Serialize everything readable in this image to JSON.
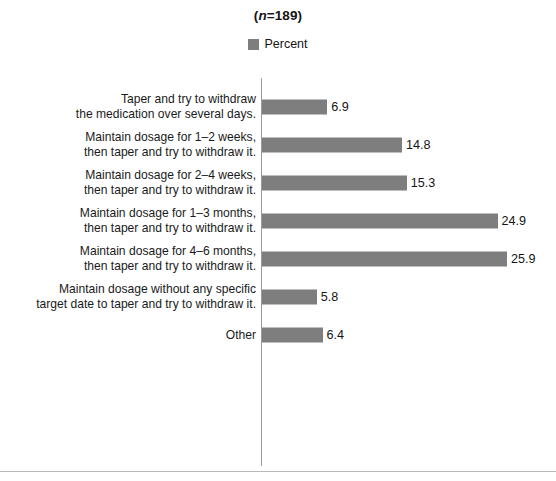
{
  "chart_data": {
    "type": "bar",
    "orientation": "horizontal",
    "title": "(n=189)",
    "title_prefix": "(",
    "title_italic": "n",
    "title_suffix": "=189)",
    "xlabel": "",
    "ylabel": "",
    "grid": false,
    "legend_position": "top-center",
    "legend": [
      "Percent"
    ],
    "series": [
      {
        "name": "Percent",
        "color": "#7e7e7e",
        "values": [
          6.9,
          14.8,
          15.3,
          24.9,
          25.9,
          5.8,
          6.4
        ]
      }
    ],
    "categories": [
      "Taper and try to withdraw\nthe medication over several days.",
      "Maintain dosage for 1–2 weeks,\nthen taper and try to withdraw it.",
      "Maintain dosage for 2–4 weeks,\nthen taper and try to withdraw it.",
      "Maintain dosage for 1–3 months,\nthen taper and try to withdraw it.",
      "Maintain dosage for 4–6 months,\nthen taper and try to withdraw it.",
      "Maintain dosage without any specific\ntarget date to taper and try to withdraw it.",
      "Other"
    ],
    "value_labels": [
      "6.9",
      "14.8",
      "15.3",
      "24.9",
      "25.9",
      "5.8",
      "6.4"
    ],
    "xlim": [
      0,
      25.9
    ],
    "axis_color": "#9a9a9a"
  },
  "colors": {
    "bar": "#7e7e7e",
    "legend_swatch": "#7e7e7e",
    "axis": "#9a9a9a",
    "rule": "#b9b9b9",
    "text": "#1a1a1a"
  }
}
